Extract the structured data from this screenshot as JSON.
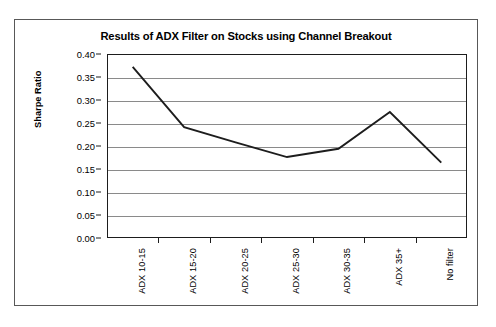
{
  "figure": {
    "title": "Results of ADX Filter on Stocks using Channel Breakout",
    "frame_color": "#585858",
    "line_color": "#1d1d1d",
    "grid_color": "#8a8a8a"
  },
  "chart_data": {
    "type": "line",
    "title": "Results of ADX Filter on Stocks using Channel Breakout",
    "xlabel": "",
    "ylabel": "Sharpe Ratio",
    "categories": [
      "ADX 10-15",
      "ADX 15-20",
      "ADX 20-25",
      "ADX 25-30",
      "ADX 30-35",
      "ADX 35+",
      "No filter"
    ],
    "values": [
      0.372,
      0.241,
      0.208,
      0.176,
      0.194,
      0.274,
      0.164
    ],
    "series": [
      {
        "name": "Sharpe Ratio",
        "values": [
          0.372,
          0.241,
          0.208,
          0.176,
          0.194,
          0.274,
          0.164
        ]
      }
    ],
    "ylim": [
      0.0,
      0.4
    ],
    "yticks": [
      0.0,
      0.05,
      0.1,
      0.15,
      0.2,
      0.25,
      0.3,
      0.35,
      0.4
    ],
    "ytick_labels": [
      "0.00",
      "0.05",
      "0.10",
      "0.15",
      "0.20",
      "0.25",
      "0.30",
      "0.35",
      "0.40"
    ],
    "grid": "horizontal",
    "legend": "none",
    "marker": "none",
    "line_color": "#1d1d1d"
  }
}
